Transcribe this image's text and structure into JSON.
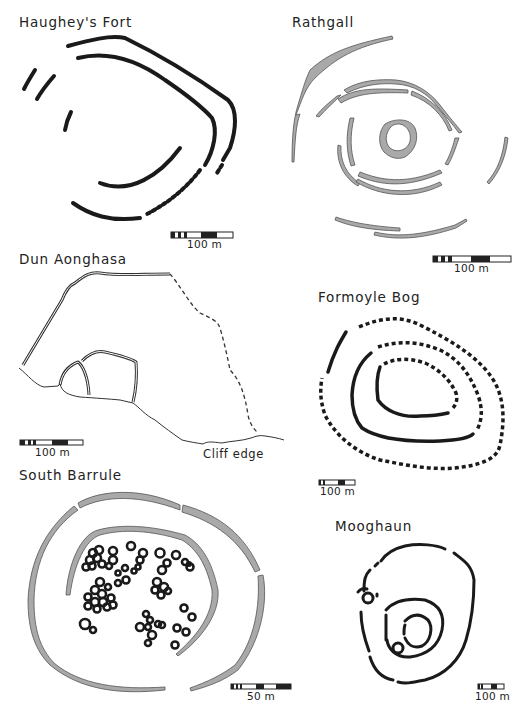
{
  "figure": {
    "panels": [
      {
        "id": "haugheys-fort",
        "title": "Haughey's Fort",
        "scale_label": "100 m",
        "rampart_style": "black lines, partly dotted"
      },
      {
        "id": "rathgall",
        "title": "Rathgall",
        "scale_label": "100 m",
        "rampart_style": "grey filled banks"
      },
      {
        "id": "dun-aonghasa",
        "title": "Dun Aonghasa",
        "scale_label": "100 m",
        "annotation": "Cliff edge",
        "rampart_style": "double-line walls, dashed conjectural wall"
      },
      {
        "id": "formoyle-bog",
        "title": "Formoyle Bog",
        "scale_label": "100 m",
        "rampart_style": "black lines, dotted"
      },
      {
        "id": "south-barrule",
        "title": "South Barrule",
        "scale_label": "50 m",
        "rampart_style": "grey filled banks with hut circles"
      },
      {
        "id": "mooghaun",
        "title": "Mooghaun",
        "scale_label": "100 m",
        "rampart_style": "black lines"
      }
    ]
  },
  "colors": {
    "line": "#1a1a1a",
    "bank_fill": "#a9a9a9",
    "bank_stroke": "#555555",
    "background": "#ffffff"
  }
}
